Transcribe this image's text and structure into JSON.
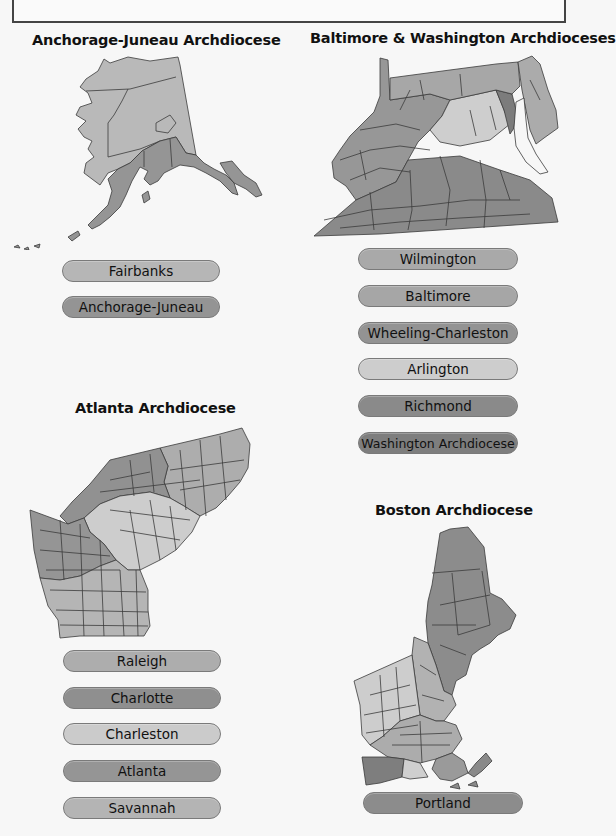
{
  "header_box": {
    "text": ""
  },
  "colors": {
    "light": "#cfcfcf",
    "mid_light": "#b4b4b4",
    "mid": "#a2a2a2",
    "mid_dark": "#8e8e8e",
    "dark": "#7d7d7d",
    "background": "#f7f7f7"
  },
  "sections": [
    {
      "title": "Anchorage-Juneau Archdiocese",
      "dioceses": [
        {
          "label": "Fairbanks",
          "color": "#b6b6b6"
        },
        {
          "label": "Anchorage-Juneau",
          "color": "#949494"
        }
      ]
    },
    {
      "title": "Baltimore & Washington Archdioceses",
      "dioceses": [
        {
          "label": "Wilmington",
          "color": "#a9a9a9"
        },
        {
          "label": "Baltimore",
          "color": "#a6a6a6"
        },
        {
          "label": "Wheeling-Charleston",
          "color": "#939393"
        },
        {
          "label": "Arlington",
          "color": "#cdcdcd"
        },
        {
          "label": "Richmond",
          "color": "#8a8a8a"
        },
        {
          "label": "Washington Archdiocese",
          "color": "#7e7e7e"
        }
      ]
    },
    {
      "title": "Atlanta Archdiocese",
      "dioceses": [
        {
          "label": "Raleigh",
          "color": "#adadad"
        },
        {
          "label": "Charlotte",
          "color": "#8f8f8f"
        },
        {
          "label": "Charleston",
          "color": "#cbcbcb"
        },
        {
          "label": "Atlanta",
          "color": "#959595"
        },
        {
          "label": "Savannah",
          "color": "#b4b4b4"
        }
      ]
    },
    {
      "title": "Boston Archdiocese",
      "dioceses": [
        {
          "label": "Portland",
          "color": "#8c8c8c"
        }
      ]
    }
  ]
}
